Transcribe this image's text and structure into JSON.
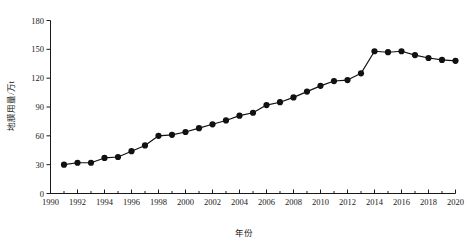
{
  "chart_data": {
    "type": "line",
    "title": "",
    "xlabel": "年份",
    "ylabel": "地膜用量/万t",
    "xlim": [
      1990,
      2020
    ],
    "ylim": [
      0,
      180
    ],
    "xticks": [
      1990,
      1992,
      1994,
      1996,
      1998,
      2000,
      2002,
      2004,
      2006,
      2008,
      2010,
      2012,
      2014,
      2016,
      2018,
      2020
    ],
    "xtick_labels": [
      "1990",
      "1992",
      "1994",
      "1996",
      "1998",
      "2000",
      "2002",
      "2004",
      "2006",
      "2008",
      "2010",
      "2012",
      "2014",
      "2016",
      "2018",
      "2020"
    ],
    "yticks": [
      0,
      30,
      60,
      90,
      120,
      150,
      180
    ],
    "ytick_labels": [
      "0",
      "30",
      "60",
      "90",
      "120",
      "150",
      "180"
    ],
    "grid": false,
    "legend": null,
    "marker": "filled-circle",
    "line_color": "#111111",
    "marker_color": "#111111",
    "x": [
      1991,
      1992,
      1993,
      1994,
      1995,
      1996,
      1997,
      1998,
      1999,
      2000,
      2001,
      2002,
      2003,
      2004,
      2005,
      2006,
      2007,
      2008,
      2009,
      2010,
      2011,
      2012,
      2013,
      2014,
      2015,
      2016,
      2017,
      2018,
      2019,
      2020
    ],
    "values": [
      30,
      32,
      32,
      37,
      38,
      44,
      50,
      60,
      61,
      64,
      68,
      72,
      76,
      81,
      84,
      92,
      95,
      100,
      106,
      112,
      117,
      118,
      125,
      148,
      147,
      148,
      144,
      141,
      139,
      138
    ],
    "series": [
      {
        "name": "地膜用量",
        "values": [
          30,
          32,
          32,
          37,
          38,
          44,
          50,
          60,
          61,
          64,
          68,
          72,
          76,
          81,
          84,
          92,
          95,
          100,
          106,
          112,
          117,
          118,
          125,
          148,
          147,
          148,
          144,
          141,
          139,
          138
        ]
      }
    ]
  },
  "figure": {
    "background_color": "#ffffff",
    "axis_color": "#1a1a1a"
  }
}
